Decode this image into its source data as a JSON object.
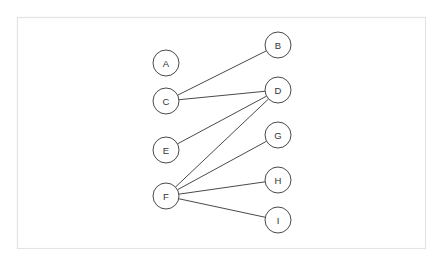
{
  "figure": {
    "background_color": "#ffffff",
    "frame": {
      "x": 17,
      "y": 17,
      "width": 408,
      "height": 231,
      "stroke_color": "#e3e3e3",
      "fill_color": "#ffffff"
    }
  },
  "style": {
    "node_radius": 13,
    "node_fill": "#ffffff",
    "node_stroke": "#4a4a4a",
    "node_stroke_width": 1,
    "label_color": "#333333",
    "edge_color": "#4a4a4a",
    "edge_width": 1
  },
  "graph": {
    "type": "node-link",
    "directed": false,
    "node_count": 9,
    "edge_count": 6,
    "nodes": [
      {
        "id": "A",
        "label": "A",
        "x": 166,
        "y": 63,
        "column": "left",
        "degree": 0
      },
      {
        "id": "B",
        "label": "B",
        "x": 278,
        "y": 45,
        "column": "right",
        "degree": 1
      },
      {
        "id": "C",
        "label": "C",
        "x": 166,
        "y": 101,
        "column": "left",
        "degree": 2
      },
      {
        "id": "D",
        "label": "D",
        "x": 278,
        "y": 90,
        "column": "right",
        "degree": 3
      },
      {
        "id": "E",
        "label": "E",
        "x": 166,
        "y": 150,
        "column": "left",
        "degree": 1
      },
      {
        "id": "G",
        "label": "G",
        "x": 278,
        "y": 135,
        "column": "right",
        "degree": 1
      },
      {
        "id": "F",
        "label": "F",
        "x": 166,
        "y": 196,
        "column": "left",
        "degree": 4
      },
      {
        "id": "H",
        "label": "H",
        "x": 278,
        "y": 180,
        "column": "right",
        "degree": 1
      },
      {
        "id": "I",
        "label": "I",
        "x": 278,
        "y": 220,
        "column": "right",
        "degree": 1
      }
    ],
    "edges": [
      {
        "source": "C",
        "target": "B"
      },
      {
        "source": "C",
        "target": "D"
      },
      {
        "source": "E",
        "target": "D"
      },
      {
        "source": "F",
        "target": "D"
      },
      {
        "source": "F",
        "target": "G"
      },
      {
        "source": "F",
        "target": "H"
      },
      {
        "source": "F",
        "target": "I"
      }
    ]
  }
}
